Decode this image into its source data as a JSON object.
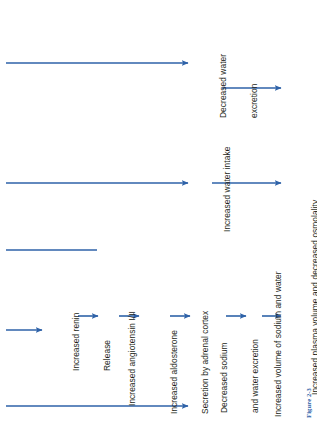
{
  "figure": {
    "caption": "Figure 2-3",
    "orientation": "rotated-90-ccw",
    "accent_color": "#2e62a8",
    "text_color": "#231f20",
    "background": "#ffffff"
  },
  "nodes": {
    "renin": {
      "line1": "Increased renin",
      "line2": "Release"
    },
    "angiotensin": {
      "line1": "Increased angiotensin I/II",
      "line2": ""
    },
    "aldosterone": {
      "line1": "Increased aldosterone",
      "line2": "Secretion by adrenal cortex"
    },
    "sodium_excretion": {
      "line1": "Decreased sodium",
      "line2": "and water excretion"
    },
    "volume": {
      "line1": "Increased volume of sodium and water",
      "line2": ""
    },
    "plasma": {
      "line1": "Increased plasma volume and decreased osmolality",
      "line2": ""
    },
    "water_excretion": {
      "line1": "Decreased water",
      "line2": "excretion"
    },
    "water_intake": {
      "line1": "Increased water intake",
      "line2": ""
    }
  },
  "connectors": [
    {
      "id": "input-to-renin",
      "kind": "arrow"
    },
    {
      "id": "renin-to-angiotensin",
      "kind": "arrow"
    },
    {
      "id": "angiotensin-to-aldosterone",
      "kind": "arrow"
    },
    {
      "id": "aldosterone-to-sodium",
      "kind": "arrow"
    },
    {
      "id": "sodium-to-volume",
      "kind": "arrow"
    },
    {
      "id": "volume-to-plasma",
      "kind": "arrow"
    },
    {
      "id": "feedback-top-rail",
      "kind": "line"
    },
    {
      "id": "rail-to-water-excretion",
      "kind": "arrow"
    },
    {
      "id": "water-excretion-to-plasma",
      "kind": "arrow"
    },
    {
      "id": "rail-to-water-intake",
      "kind": "arrow"
    },
    {
      "id": "water-intake-to-plasma",
      "kind": "arrow"
    },
    {
      "id": "bottom-rail-to-sodium",
      "kind": "arrow"
    }
  ]
}
